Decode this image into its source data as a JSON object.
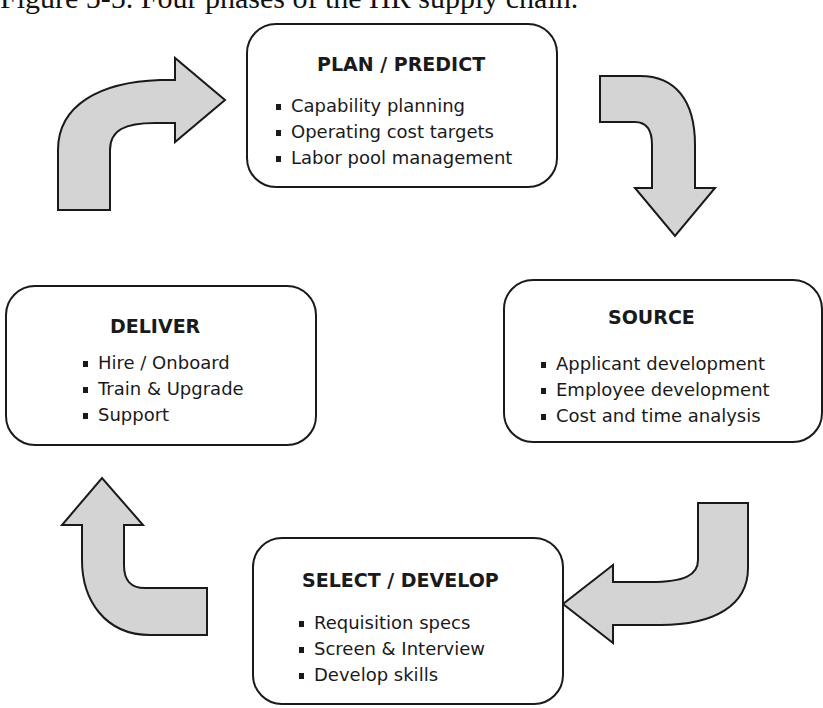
{
  "caption": "Figure 5-5. Four phases of the HR supply chain.",
  "colors": {
    "arrow_fill": "#d4d4d4",
    "stroke": "#1a1a1a",
    "box_fill": "#ffffff"
  },
  "phases": [
    {
      "id": "plan",
      "title": "PLAN / PREDICT",
      "items": [
        "Capability planning",
        "Operating cost targets",
        "Labor pool management"
      ]
    },
    {
      "id": "source",
      "title": "SOURCE",
      "items": [
        "Applicant development",
        "Employee development",
        "Cost and time analysis"
      ]
    },
    {
      "id": "select",
      "title": "SELECT / DEVELOP",
      "items": [
        "Requisition specs",
        "Screen & Interview",
        "Develop skills"
      ]
    },
    {
      "id": "deliver",
      "title": "DELIVER",
      "items": [
        "Hire / Onboard",
        "Train & Upgrade",
        "Support"
      ]
    }
  ],
  "flow": [
    {
      "from": "deliver",
      "to": "plan",
      "icon": "curved-arrow-up-right"
    },
    {
      "from": "plan",
      "to": "source",
      "icon": "curved-arrow-right-down"
    },
    {
      "from": "source",
      "to": "select",
      "icon": "curved-arrow-down-left"
    },
    {
      "from": "select",
      "to": "deliver",
      "icon": "curved-arrow-left-up"
    }
  ]
}
